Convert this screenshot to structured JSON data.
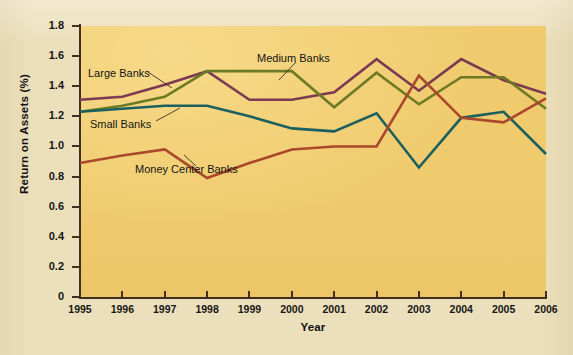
{
  "chart_data": {
    "type": "line",
    "title": "",
    "xlabel": "Year",
    "ylabel": "Return on Assets (%)",
    "x": [
      1995,
      1996,
      1997,
      1998,
      1999,
      2000,
      2001,
      2002,
      2003,
      2004,
      2005,
      2006
    ],
    "xlim": [
      1995,
      2006
    ],
    "ylim": [
      0,
      1.8
    ],
    "y_ticks": [
      "0",
      "0.2",
      "0.4",
      "0.6",
      "0.8",
      "1.0",
      "1.2",
      "1.4",
      "1.6",
      "1.8"
    ],
    "y_tick_values": [
      0,
      0.2,
      0.4,
      0.6,
      0.8,
      1.0,
      1.2,
      1.4,
      1.6,
      1.8
    ],
    "x_tick_labels": [
      "1995",
      "1996",
      "1997",
      "1998",
      "1999",
      "2000",
      "2001",
      "2002",
      "2003",
      "2004",
      "2005",
      "2006"
    ],
    "grid": false,
    "legend_position": "inline-annotations",
    "series": [
      {
        "name": "Large Banks",
        "color": "#7b3a52",
        "values": [
          1.31,
          1.33,
          1.41,
          1.5,
          1.31,
          1.31,
          1.36,
          1.58,
          1.37,
          1.58,
          1.44,
          1.35
        ]
      },
      {
        "name": "Medium Banks",
        "color": "#6d7a23",
        "values": [
          1.23,
          1.27,
          1.33,
          1.5,
          1.5,
          1.5,
          1.26,
          1.49,
          1.28,
          1.46,
          1.46,
          1.25
        ]
      },
      {
        "name": "Small Banks",
        "color": "#1b5f5e",
        "values": [
          1.23,
          1.25,
          1.27,
          1.27,
          1.2,
          1.12,
          1.1,
          1.22,
          0.86,
          1.19,
          1.23,
          0.95
        ]
      },
      {
        "name": "Money Center Banks",
        "color": "#a9482a",
        "values": [
          0.89,
          0.94,
          0.98,
          0.79,
          0.89,
          0.98,
          1.0,
          1.0,
          1.47,
          1.19,
          1.16,
          1.32
        ]
      }
    ],
    "annotations": [
      {
        "text": "Large Banks",
        "series": "Large Banks"
      },
      {
        "text": "Medium Banks",
        "series": "Medium Banks"
      },
      {
        "text": "Small Banks",
        "series": "Small Banks"
      },
      {
        "text": "Money Center Banks",
        "series": "Money Center Banks"
      }
    ]
  },
  "colors": {
    "page_background": "#ece0bc",
    "plot_background": "#f0cb6e",
    "axis": "#403024",
    "large_banks": "#7b3a52",
    "medium_banks": "#6d7a23",
    "small_banks": "#1b5f5e",
    "money_center_banks": "#a9482a"
  },
  "ghost_text": {
    "heading": "Return on Equity",
    "line1": "return on equity (ROE),",
    "line2": "the after-tax ROE is as follows:",
    "line3": "ROE = ROA × Equity multiplier",
    "line4": "Net income     Net income     Total assets",
    "line5": "Equity capital   Total assets     Equity capital"
  }
}
